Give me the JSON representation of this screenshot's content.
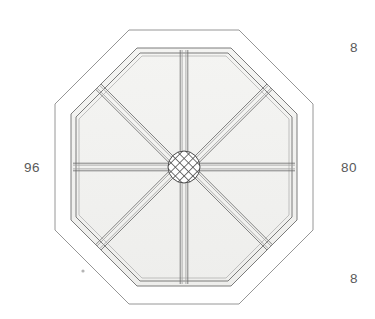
{
  "drawing": {
    "title": "Octagonal spoked frame — plan view",
    "view_type": "orthographic-plan",
    "background_color": "#ffffff",
    "line_color": "#6e6e6e",
    "fill_color": "#f2f2f0",
    "hatch_color": "#4a4a4a",
    "dimension_text_color": "#5a5a5a"
  },
  "dimensions": {
    "left": "96",
    "right": "80",
    "top_right": "8",
    "bottom_right": "8"
  },
  "geometry": {
    "center": {
      "x": 184,
      "y": 167
    },
    "outer_octagon": {
      "name": "outer-octagon-outline",
      "half_width": 129,
      "half_height": 137,
      "flat_half": 55,
      "stroke_width": 0.9
    },
    "inner_octagon": {
      "name": "inner-octagon-rim",
      "half_width": 113,
      "half_height": 119,
      "flat_half": 47,
      "band_offset": 5,
      "stroke_width": 0.9
    },
    "spokes": {
      "name": "radial-spokes",
      "count": 8,
      "beam_lines": 4,
      "beam_half_width": 3.4,
      "angles_deg": [
        0,
        45,
        90,
        135,
        180,
        225,
        270,
        315
      ]
    },
    "hub": {
      "name": "center-hub",
      "radius": 16,
      "hatch_spacing": 3.1,
      "hatch_angles_deg": [
        45,
        -45
      ]
    },
    "mark": {
      "name": "reference-dot",
      "x": 83,
      "y": 271,
      "radius": 1.6
    }
  }
}
